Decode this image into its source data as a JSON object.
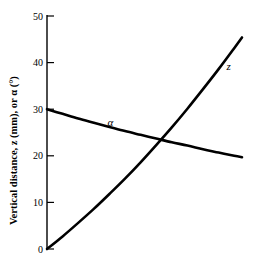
{
  "chart_data": {
    "type": "line",
    "title": "",
    "subtitle": "",
    "xlabel": "",
    "ylabel": "Vertical distance, z (mm), or α (°)",
    "ylim": [
      0,
      50
    ],
    "yticks": [
      0,
      10,
      20,
      30,
      40,
      50
    ],
    "ytick_labels": [
      "0",
      "10",
      "20",
      "30",
      "40",
      "50"
    ],
    "xlim": [
      0,
      100
    ],
    "xticks": [],
    "xtick_labels": [],
    "grid": false,
    "legend": "inline-curve-labels",
    "annotations": [
      {
        "text": "α",
        "x": 31,
        "y": 26.5
      },
      {
        "text": "z",
        "x": 92,
        "y": 38.5
      }
    ],
    "series": [
      {
        "name": "z",
        "label": "z",
        "color": "#000000",
        "x": [
          0,
          8,
          16,
          24,
          32,
          40,
          48,
          56,
          64,
          72,
          80,
          88,
          96,
          100
        ],
        "y": [
          0.0,
          2.7,
          5.6,
          8.6,
          11.8,
          15.1,
          18.6,
          22.3,
          26.1,
          30.1,
          34.3,
          38.6,
          43.1,
          45.4
        ]
      },
      {
        "name": "alpha",
        "label": "α",
        "color": "#000000",
        "x": [
          0,
          8,
          16,
          24,
          32,
          40,
          48,
          56,
          64,
          72,
          80,
          88,
          96,
          100
        ],
        "y": [
          30.0,
          29.0,
          28.0,
          27.1,
          26.2,
          25.3,
          24.5,
          23.7,
          22.9,
          22.2,
          21.4,
          20.7,
          20.0,
          19.7
        ]
      }
    ],
    "intersection": {
      "x": 58,
      "y": 23.0
    }
  },
  "axes": {
    "y_axis_name": "y-axis",
    "tick_0": "0",
    "tick_10": "10",
    "tick_20": "20",
    "tick_30": "30",
    "tick_40": "40",
    "tick_50": "50"
  }
}
